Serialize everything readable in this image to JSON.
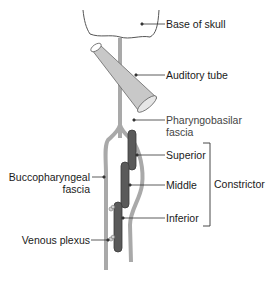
{
  "diagram": {
    "labels": {
      "base_of_skull": "Base of skull",
      "auditory_tube": "Auditory tube",
      "pharyngobasilar_line1": "Pharyngobasilar",
      "pharyngobasilar_line2": "fascia",
      "superior": "Superior",
      "middle": "Middle",
      "inferior": "Inferior",
      "constrictor": "Constrictor",
      "buccopharyngeal_line1": "Buccopharyngeal",
      "buccopharyngeal_line2": "fascia",
      "venous_plexus": "Venous plexus"
    },
    "colors": {
      "fascia": "#a9a9a9",
      "muscle": "#5a5a5a",
      "muscle_outline": "#3a3a3a",
      "tube_fill": "#c8c8c8",
      "skull_fill": "#ffffff",
      "outline": "#555555",
      "leader": "#333333"
    }
  }
}
